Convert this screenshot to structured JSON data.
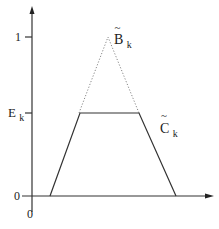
{
  "diagram": {
    "type": "membership-function-plot",
    "axes": {
      "y_tick_labels": [
        "1",
        "E",
        "0"
      ],
      "y_tick_sub": {
        "E": "k"
      },
      "x_origin_label": "0"
    },
    "curves": [
      {
        "name": "B",
        "subscript": "k",
        "tilde": "~",
        "style": "dotted",
        "shape": "triangle",
        "points": [
          [
            50,
            196
          ],
          [
            108,
            37
          ],
          [
            176,
            196
          ]
        ]
      },
      {
        "name": "C",
        "subscript": "k",
        "tilde": "~",
        "style": "solid",
        "shape": "trapezoid",
        "points": [
          [
            50,
            196
          ],
          [
            80,
            113
          ],
          [
            139,
            113
          ],
          [
            176,
            196
          ]
        ]
      }
    ],
    "labels": {
      "one": "1",
      "ek_main": "E",
      "ek_sub": "k",
      "zero_left": "0",
      "zero_bottom": "0",
      "b_main": "B",
      "b_sub": "k",
      "b_tilde": "~",
      "c_main": "C",
      "c_sub": "k",
      "c_tilde": "~"
    },
    "colors": {
      "line": "#333333",
      "dotted": "#888888"
    }
  }
}
